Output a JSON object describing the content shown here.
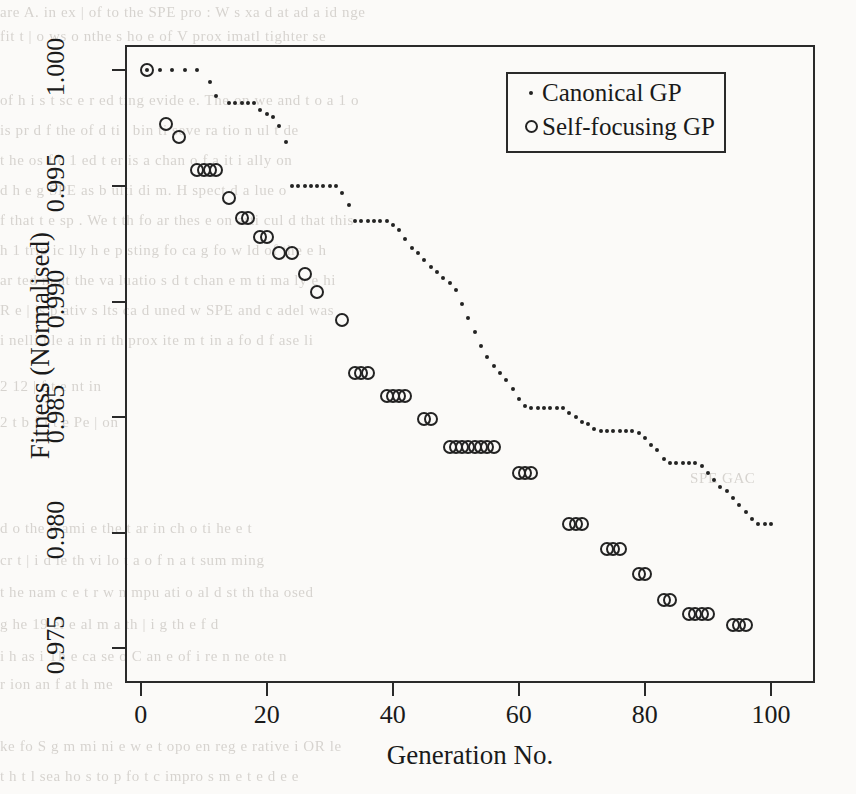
{
  "figure": {
    "background_text_top": [
      "are A. in  ex  | of  to  the   SPE   pro :  W  s xa  d at ad a  id  nge",
      "fit  t  | o  ws  o  nthe  s  ho  e  of  V  prox  imatl  tighter  se"
    ],
    "background_text_mid": [
      "of  h  i  s  t  sc  e  r  ed  ting  evide  e.  The   on  we  and  t o  a  1 o",
      "is  pr  d  f  the  of  d  ti  |  bin  ti   seve  ra  tio  n  ul  t  de",
      "t  he  os  f  c  1   ed  t  er  is  a  chan  o   f  a  it  i  ally  on",
      "d  h  e  g  SPE  as  b  ulti  di  m.  H  spect  d  a  lue  o",
      "f  that  t  e  sp   . We  t  th  fo  ar   thes  e  on  arti  cul  d  that  this",
      "h  1  trip  ic  lly  h  e  p  sting  fo  ca  g  fo  w  ld  of  the  e  h",
      "ar  ted  m  at  the  va  luatio  s  d  t  chan  e  m  ti  ma  ly  e  hi",
      "R  e  |  is  p  ativ  s  lts  ca  d  uned  w  SPE  and  c  adel  was",
      "i  nelli  ble  a  in  ri  th  prox  ite  m  t  in  a  fo  d  f  ase  li"
    ],
    "background_text_right": [
      "2  12  |  f  t  e  nt  in",
      "2  t  b  f  i  t  e  Pe  |  on",
      "SPE  GAC"
    ],
    "background_text_bottom": [
      "d  o  the  n  ami  e  the  t  ar  in  ch  o  ti  he  e  t",
      "cr  t  |  i  d  le  th  vi  lo  t  a  o   f  n  a  t  sum  ming",
      "t  he  nam  c  e  t   r  w  n  mpu  ati  o  al  d  st  th  tha  osed",
      "g  he  19  el  e  al  m  a  th  |  i  g  th  e  f  d",
      "i  h  as  i  Th  e  ca  se  o  C  an  e  of  i  re   n  ne  ote  n",
      "r  ion  an  f  at  h  me",
      "ke  fo  S  g  m  mi  ni  e  w  e  t  opo  en  reg  e  rative  i  OR  le",
      "t  h  t   l  sea  ho  s  to  p  fo  t  c  impro  s  m  e  t  e  d  e  e"
    ],
    "axes": {
      "ylabel": "Fitness (Normalised)",
      "xlabel": "Generation No.",
      "yticks": [
        "0.975",
        "0.980",
        "0.985",
        "0.990",
        "0.995",
        "1.000"
      ],
      "xticks": [
        "0",
        "20",
        "40",
        "60",
        "80",
        "100"
      ]
    },
    "legend": {
      "entries": [
        {
          "marker": "dot-marker-icon",
          "label": "Canonical GP"
        },
        {
          "marker": "circle-marker-icon",
          "label": "Self-focusing GP"
        }
      ]
    }
  },
  "chart_data": {
    "type": "scatter",
    "title": "",
    "xlabel": "Generation No.",
    "ylabel": "Fitness (Normalised)",
    "xlim": [
      -2.5,
      107
    ],
    "ylim": [
      0.9735,
      1.0011
    ],
    "grid": false,
    "legend_position": "top-right",
    "series": [
      {
        "name": "Canonical GP",
        "marker": "dot",
        "x": [
          1,
          3,
          5,
          7,
          9,
          11,
          12,
          14,
          15,
          16,
          17,
          18,
          19,
          20,
          21,
          22,
          23,
          24,
          25,
          26,
          27,
          28,
          29,
          30,
          31,
          32,
          33,
          34,
          35,
          36,
          37,
          38,
          39,
          40,
          41,
          42,
          43,
          44,
          45,
          46,
          47,
          48,
          49,
          50,
          51,
          52,
          53,
          54,
          55,
          56,
          57,
          58,
          59,
          60,
          61,
          62,
          63,
          64,
          65,
          66,
          67,
          68,
          69,
          70,
          71,
          72,
          73,
          74,
          75,
          76,
          77,
          78,
          79,
          80,
          81,
          82,
          83,
          84,
          85,
          86,
          87,
          88,
          89,
          90,
          91,
          92,
          93,
          94,
          95,
          96,
          97,
          98,
          99,
          100
        ],
        "y": [
          1.0,
          1.0,
          1.0,
          1.0,
          1.0,
          0.9995,
          0.9989,
          0.9986,
          0.9986,
          0.9986,
          0.9986,
          0.9986,
          0.9983,
          0.9981,
          0.998,
          0.9976,
          0.9969,
          0.995,
          0.995,
          0.995,
          0.995,
          0.995,
          0.995,
          0.995,
          0.995,
          0.9947,
          0.9942,
          0.9935,
          0.9935,
          0.9935,
          0.9935,
          0.9935,
          0.9935,
          0.9933,
          0.9931,
          0.9927,
          0.9923,
          0.9921,
          0.9918,
          0.9915,
          0.9913,
          0.991,
          0.9908,
          0.9905,
          0.9899,
          0.9893,
          0.9887,
          0.9881,
          0.9876,
          0.9872,
          0.9869,
          0.9866,
          0.9862,
          0.9858,
          0.9855,
          0.9854,
          0.9854,
          0.9854,
          0.9854,
          0.9854,
          0.9854,
          0.9852,
          0.985,
          0.9848,
          0.9847,
          0.9845,
          0.9844,
          0.9844,
          0.9844,
          0.9844,
          0.9844,
          0.9844,
          0.9843,
          0.9841,
          0.9838,
          0.9836,
          0.9832,
          0.983,
          0.983,
          0.983,
          0.983,
          0.983,
          0.9829,
          0.9826,
          0.9823,
          0.982,
          0.9818,
          0.9815,
          0.9812,
          0.9809,
          0.9806,
          0.9804,
          0.9804,
          0.9804
        ],
        "endpoint_value": 0.9804
      },
      {
        "name": "Self-focusing GP",
        "marker": "circle",
        "x": [
          1,
          4,
          6,
          9,
          10,
          11,
          12,
          14,
          16,
          17,
          19,
          20,
          22,
          24,
          26,
          28,
          32,
          34,
          35,
          36,
          39,
          40,
          41,
          42,
          45,
          46,
          49,
          50,
          51,
          52,
          53,
          54,
          55,
          56,
          60,
          61,
          62,
          68,
          69,
          70,
          74,
          75,
          76,
          79,
          80,
          83,
          84,
          87,
          88,
          89,
          90,
          94,
          95,
          96
        ],
        "y": [
          1.0,
          0.9977,
          0.9971,
          0.9957,
          0.9957,
          0.9957,
          0.9957,
          0.9945,
          0.9936,
          0.9936,
          0.9928,
          0.9928,
          0.9921,
          0.9921,
          0.9912,
          0.9904,
          0.9892,
          0.9869,
          0.9869,
          0.9869,
          0.9859,
          0.9859,
          0.9859,
          0.9859,
          0.9849,
          0.9849,
          0.9837,
          0.9837,
          0.9837,
          0.9837,
          0.9837,
          0.9837,
          0.9837,
          0.9837,
          0.9826,
          0.9826,
          0.9826,
          0.9804,
          0.9804,
          0.9804,
          0.9793,
          0.9793,
          0.9793,
          0.9782,
          0.9782,
          0.9771,
          0.9771,
          0.9765,
          0.9765,
          0.9765,
          0.9765,
          0.976,
          0.976,
          0.976
        ]
      }
    ]
  }
}
